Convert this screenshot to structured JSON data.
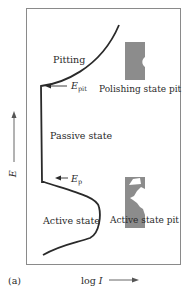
{
  "figure": {
    "panel_label": "(a)",
    "x_axis_label": "log I",
    "y_axis_label": "E",
    "regions": {
      "pitting": "Pitting",
      "passive": "Passive state",
      "active": "Active state"
    },
    "markers": {
      "e_pit": {
        "symbol": "E",
        "subscript": "pit"
      },
      "e_p": {
        "symbol": "E",
        "subscript": "p"
      }
    },
    "pit_illustrations": {
      "polishing": "Polishing state pit",
      "active": "Active state pit"
    },
    "colors": {
      "curve": "#2a2a2a",
      "frame": "#8a8a8a",
      "pit_fill": "#8c8c8c"
    }
  }
}
